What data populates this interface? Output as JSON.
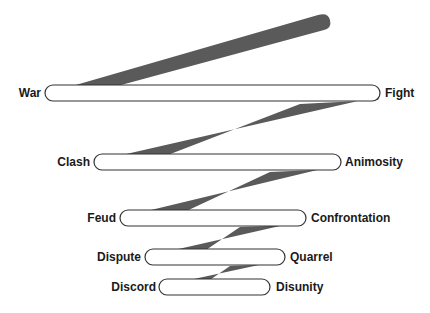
{
  "diagram": {
    "type": "zigzag-escalation",
    "band_color": "#5a5a5a",
    "pill_fill": "#ffffff",
    "pill_stroke": "#333333",
    "levels": [
      {
        "left": "War",
        "right": "Fight"
      },
      {
        "left": "Clash",
        "right": "Animosity"
      },
      {
        "left": "Feud",
        "right": "Confrontation"
      },
      {
        "left": "Dispute",
        "right": "Quarrel"
      },
      {
        "left": "Discord",
        "right": "Disunity"
      }
    ]
  }
}
